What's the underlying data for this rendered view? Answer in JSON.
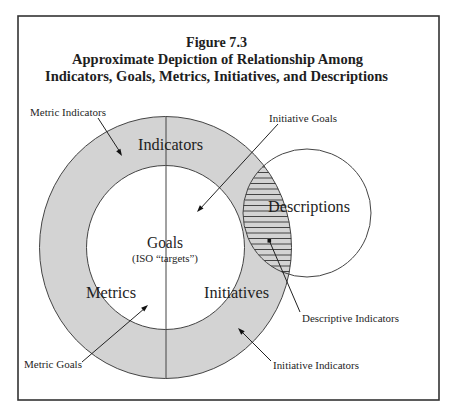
{
  "figure": {
    "number": "Figure 7.3",
    "title_line1": "Approximate Depiction of Relationship Among",
    "title_line2": "Indicators, Goals, Metrics, Initiatives, and Descriptions"
  },
  "regions": {
    "indicators": "Indicators",
    "goals": "Goals",
    "goals_note": "(ISO “targets”)",
    "metrics": "Metrics",
    "initiatives": "Initiatives",
    "descriptions": "Descriptions"
  },
  "callouts": {
    "metric_indicators": "Metric Indicators",
    "initiative_goals": "Initiative Goals",
    "metric_goals": "Metric Goals",
    "descriptive_indicators": "Descriptive Indicators",
    "initiative_indicators": "Initiative Indicators"
  },
  "colors": {
    "ring_fill": "#d3d3d3",
    "inner_fill": "#ffffff",
    "outline": "#444444",
    "frame": "#333333"
  }
}
